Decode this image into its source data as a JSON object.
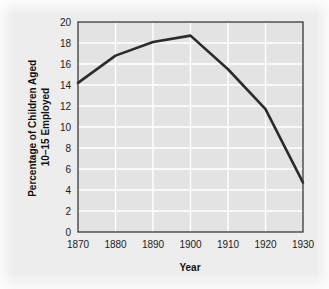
{
  "figure": {
    "background_color": "#ededed",
    "plot_background_color": "#e3e3e3",
    "grid_color": "#ffffff",
    "frame_color": "#3a3a3a",
    "line_color": "#2b2b2b",
    "page_background_color": "#ffffff"
  },
  "chart_data": {
    "type": "line",
    "title": "",
    "xlabel": "Year",
    "ylabel": "Percentage of Children Aged 10–15 Employed",
    "ylabel_lines": [
      "Percentage of Children Aged",
      "10–15 Employed"
    ],
    "x": [
      1870,
      1880,
      1890,
      1900,
      1910,
      1920,
      1930
    ],
    "values": [
      14.2,
      16.8,
      18.1,
      18.7,
      15.5,
      11.7,
      4.7
    ],
    "series": [
      {
        "name": "Percentage of children aged 10–15 employed",
        "values": [
          14.2,
          16.8,
          18.1,
          18.7,
          15.5,
          11.7,
          4.7
        ]
      }
    ],
    "xlim": [
      1870,
      1930
    ],
    "ylim": [
      0,
      20
    ],
    "xticks": [
      1870,
      1880,
      1890,
      1900,
      1910,
      1920,
      1930
    ],
    "xtick_labels": [
      "1870",
      "1880",
      "1890",
      "1900",
      "1910",
      "1920",
      "1930"
    ],
    "yticks": [
      0,
      2,
      4,
      6,
      8,
      10,
      12,
      14,
      16,
      18,
      20
    ],
    "ytick_labels": [
      "0",
      "2",
      "4",
      "6",
      "8",
      "10",
      "12",
      "14",
      "16",
      "18",
      "20"
    ],
    "grid": true,
    "grid_axis": "both",
    "legend": false,
    "legend_position": "none",
    "annotations": []
  }
}
